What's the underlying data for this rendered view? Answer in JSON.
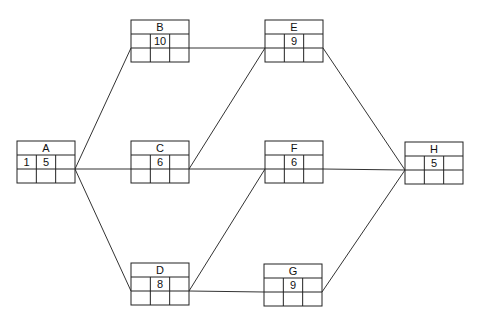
{
  "nodes": [
    {
      "id": "A",
      "label": "A",
      "cells": [
        "1",
        "5",
        "",
        "",
        "",
        ""
      ]
    },
    {
      "id": "B",
      "label": "B",
      "cells": [
        "",
        "10",
        "",
        "",
        "",
        ""
      ]
    },
    {
      "id": "C",
      "label": "C",
      "cells": [
        "",
        "6",
        "",
        "",
        "",
        ""
      ]
    },
    {
      "id": "D",
      "label": "D",
      "cells": [
        "",
        "8",
        "",
        "",
        "",
        ""
      ]
    },
    {
      "id": "E",
      "label": "E",
      "cells": [
        "",
        "9",
        "",
        "",
        "",
        ""
      ]
    },
    {
      "id": "F",
      "label": "F",
      "cells": [
        "",
        "6",
        "",
        "",
        "",
        ""
      ]
    },
    {
      "id": "G",
      "label": "G",
      "cells": [
        "",
        "9",
        "",
        "",
        "",
        ""
      ]
    },
    {
      "id": "H",
      "label": "H",
      "cells": [
        "",
        "5",
        "",
        "",
        "",
        ""
      ]
    }
  ],
  "edges": [
    [
      "A",
      "B"
    ],
    [
      "A",
      "C"
    ],
    [
      "A",
      "D"
    ],
    [
      "B",
      "E"
    ],
    [
      "C",
      "E"
    ],
    [
      "C",
      "F"
    ],
    [
      "D",
      "F"
    ],
    [
      "D",
      "G"
    ],
    [
      "E",
      "H"
    ],
    [
      "F",
      "H"
    ],
    [
      "G",
      "H"
    ]
  ]
}
